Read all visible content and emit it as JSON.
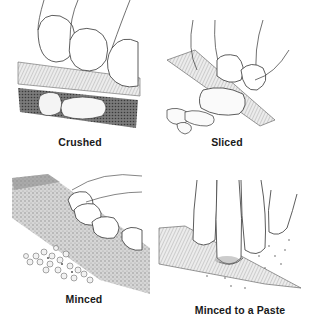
{
  "figure": {
    "panels": [
      {
        "id": "crushed",
        "caption": "Crushed"
      },
      {
        "id": "sliced",
        "caption": "Sliced"
      },
      {
        "id": "minced",
        "caption": "Minced"
      },
      {
        "id": "paste",
        "caption": "Minced to a Paste"
      }
    ]
  },
  "colors": {
    "background": "#ffffff",
    "ink": "#1a1a1a",
    "blade_shade": "#b8b8b8"
  }
}
